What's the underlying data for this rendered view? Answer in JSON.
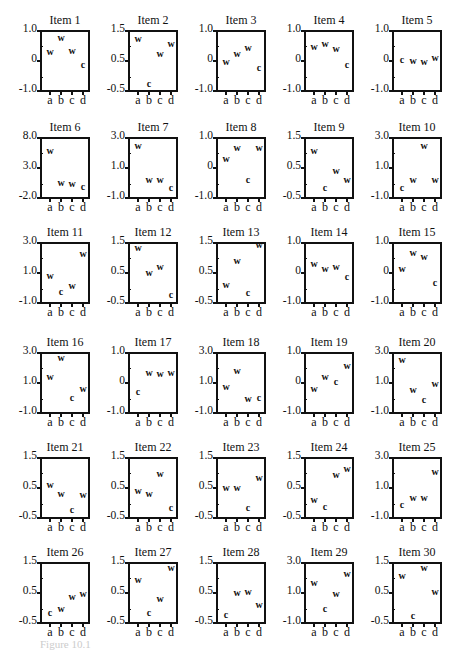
{
  "chart_data": {
    "type": "scatter",
    "layout": "small multiples, 6 rows x 5 columns",
    "categories": [
      "a",
      "b",
      "c",
      "d"
    ],
    "marker_legend": {
      "w": "w marker",
      "c": "c marker"
    },
    "panels": [
      {
        "title": "Item 1",
        "ylim": [
          -1.0,
          1.0
        ],
        "yticks": [
          "1.0",
          "0",
          "-1.0"
        ],
        "points": [
          {
            "x": "a",
            "y": 0.3,
            "m": "w"
          },
          {
            "x": "b",
            "y": 0.8,
            "m": "w"
          },
          {
            "x": "c",
            "y": 0.35,
            "m": "w"
          },
          {
            "x": "d",
            "y": -0.15,
            "m": "c"
          }
        ]
      },
      {
        "title": "Item 2",
        "ylim": [
          -0.5,
          1.5
        ],
        "yticks": [
          "1.5",
          "0.5",
          "-0.5"
        ],
        "points": [
          {
            "x": "a",
            "y": 1.25,
            "m": "w"
          },
          {
            "x": "b",
            "y": -0.3,
            "m": "c"
          },
          {
            "x": "c",
            "y": 0.75,
            "m": "w"
          },
          {
            "x": "d",
            "y": 1.1,
            "m": "w"
          }
        ]
      },
      {
        "title": "Item 3",
        "ylim": [
          -1.0,
          1.0
        ],
        "yticks": [
          "1.0",
          "0",
          "-1.0"
        ],
        "points": [
          {
            "x": "a",
            "y": -0.05,
            "m": "w"
          },
          {
            "x": "b",
            "y": 0.25,
            "m": "w"
          },
          {
            "x": "c",
            "y": 0.45,
            "m": "w"
          },
          {
            "x": "d",
            "y": -0.25,
            "m": "c"
          }
        ]
      },
      {
        "title": "Item 4",
        "ylim": [
          -1.0,
          1.0
        ],
        "yticks": [
          "1.0",
          "0",
          "-1.0"
        ],
        "points": [
          {
            "x": "a",
            "y": 0.5,
            "m": "w"
          },
          {
            "x": "b",
            "y": 0.6,
            "m": "w"
          },
          {
            "x": "c",
            "y": 0.4,
            "m": "w"
          },
          {
            "x": "d",
            "y": -0.15,
            "m": "c"
          }
        ]
      },
      {
        "title": "Item 5",
        "ylim": [
          -1.0,
          1.0
        ],
        "yticks": [
          "1.0",
          "0",
          "-1.0"
        ],
        "points": [
          {
            "x": "a",
            "y": 0.05,
            "m": "c"
          },
          {
            "x": "b",
            "y": 0.0,
            "m": "w"
          },
          {
            "x": "c",
            "y": -0.05,
            "m": "w"
          },
          {
            "x": "d",
            "y": 0.1,
            "m": "w"
          }
        ]
      },
      {
        "title": "Item 6",
        "ylim": [
          -2.0,
          8.0
        ],
        "yticks": [
          "8.0",
          "3.0",
          "-2.0"
        ],
        "points": [
          {
            "x": "a",
            "y": 6.0,
            "m": "w"
          },
          {
            "x": "b",
            "y": 0.5,
            "m": "w"
          },
          {
            "x": "c",
            "y": 0.3,
            "m": "w"
          },
          {
            "x": "d",
            "y": -0.2,
            "m": "c"
          }
        ]
      },
      {
        "title": "Item 7",
        "ylim": [
          -1.0,
          3.0
        ],
        "yticks": [
          "3.0",
          "1.0",
          "-1.0"
        ],
        "points": [
          {
            "x": "a",
            "y": 2.5,
            "m": "w"
          },
          {
            "x": "b",
            "y": 0.2,
            "m": "w"
          },
          {
            "x": "c",
            "y": 0.2,
            "m": "w"
          },
          {
            "x": "d",
            "y": -0.4,
            "m": "c"
          }
        ]
      },
      {
        "title": "Item 8",
        "ylim": [
          -1.0,
          1.0
        ],
        "yticks": [
          "1.0",
          "0",
          "-1.0"
        ],
        "points": [
          {
            "x": "a",
            "y": 0.3,
            "m": "w"
          },
          {
            "x": "b",
            "y": 0.7,
            "m": "w"
          },
          {
            "x": "c",
            "y": -0.4,
            "m": "c"
          },
          {
            "x": "d",
            "y": 0.7,
            "m": "w"
          }
        ]
      },
      {
        "title": "Item 9",
        "ylim": [
          -0.5,
          1.5
        ],
        "yticks": [
          "1.5",
          "0.5",
          "-0.5"
        ],
        "points": [
          {
            "x": "a",
            "y": 1.1,
            "m": "w"
          },
          {
            "x": "b",
            "y": -0.2,
            "m": "c"
          },
          {
            "x": "c",
            "y": 0.4,
            "m": "w"
          },
          {
            "x": "d",
            "y": 0.1,
            "m": "w"
          }
        ]
      },
      {
        "title": "Item 10",
        "ylim": [
          -1.0,
          3.0
        ],
        "yticks": [
          "3.0",
          "1.0",
          "-1.0"
        ],
        "points": [
          {
            "x": "a",
            "y": -0.4,
            "m": "c"
          },
          {
            "x": "b",
            "y": 0.2,
            "m": "w"
          },
          {
            "x": "c",
            "y": 2.5,
            "m": "w"
          },
          {
            "x": "d",
            "y": 0.2,
            "m": "w"
          }
        ]
      },
      {
        "title": "Item 11",
        "ylim": [
          -1.0,
          3.0
        ],
        "yticks": [
          "3.0",
          "1.0",
          "-1.0"
        ],
        "points": [
          {
            "x": "a",
            "y": 0.8,
            "m": "w"
          },
          {
            "x": "b",
            "y": -0.3,
            "m": "c"
          },
          {
            "x": "c",
            "y": 0.1,
            "m": "w"
          },
          {
            "x": "d",
            "y": 2.3,
            "m": "w"
          }
        ]
      },
      {
        "title": "Item 12",
        "ylim": [
          -0.5,
          1.5
        ],
        "yticks": [
          "1.5",
          "0.5",
          "-0.5"
        ],
        "points": [
          {
            "x": "a",
            "y": 1.35,
            "m": "w"
          },
          {
            "x": "b",
            "y": 0.5,
            "m": "w"
          },
          {
            "x": "c",
            "y": 0.7,
            "m": "w"
          },
          {
            "x": "d",
            "y": -0.25,
            "m": "c"
          }
        ]
      },
      {
        "title": "Item 13",
        "ylim": [
          -0.5,
          1.5
        ],
        "yticks": [
          "1.5",
          "0.5",
          "-0.5"
        ],
        "points": [
          {
            "x": "a",
            "y": 0.1,
            "m": "w"
          },
          {
            "x": "b",
            "y": 0.9,
            "m": "w"
          },
          {
            "x": "c",
            "y": -0.2,
            "m": "c"
          },
          {
            "x": "d",
            "y": 1.45,
            "m": "w"
          }
        ]
      },
      {
        "title": "Item 14",
        "ylim": [
          -1.0,
          1.0
        ],
        "yticks": [
          "1.0",
          "0",
          "-1.0"
        ],
        "points": [
          {
            "x": "a",
            "y": 0.3,
            "m": "w"
          },
          {
            "x": "b",
            "y": 0.15,
            "m": "w"
          },
          {
            "x": "c",
            "y": 0.2,
            "m": "w"
          },
          {
            "x": "d",
            "y": -0.15,
            "m": "c"
          }
        ]
      },
      {
        "title": "Item 15",
        "ylim": [
          -1.0,
          1.0
        ],
        "yticks": [
          "1.0",
          "0",
          "-1.0"
        ],
        "points": [
          {
            "x": "a",
            "y": 0.15,
            "m": "w"
          },
          {
            "x": "b",
            "y": 0.7,
            "m": "w"
          },
          {
            "x": "c",
            "y": 0.55,
            "m": "w"
          },
          {
            "x": "d",
            "y": -0.35,
            "m": "c"
          }
        ]
      },
      {
        "title": "Item 16",
        "ylim": [
          -1.0,
          3.0
        ],
        "yticks": [
          "3.0",
          "1.0",
          "-1.0"
        ],
        "points": [
          {
            "x": "a",
            "y": 1.4,
            "m": "w"
          },
          {
            "x": "b",
            "y": 2.7,
            "m": "w"
          },
          {
            "x": "c",
            "y": 0.0,
            "m": "c"
          },
          {
            "x": "d",
            "y": 0.6,
            "m": "w"
          }
        ]
      },
      {
        "title": "Item 17",
        "ylim": [
          -1.0,
          1.0
        ],
        "yticks": [
          "1.0",
          "0",
          "-1.0"
        ],
        "points": [
          {
            "x": "a",
            "y": -0.3,
            "m": "c"
          },
          {
            "x": "b",
            "y": 0.35,
            "m": "w"
          },
          {
            "x": "c",
            "y": 0.3,
            "m": "w"
          },
          {
            "x": "d",
            "y": 0.35,
            "m": "w"
          }
        ]
      },
      {
        "title": "Item 18",
        "ylim": [
          -1.0,
          3.0
        ],
        "yticks": [
          "3.0",
          "1.0",
          "-1.0"
        ],
        "points": [
          {
            "x": "a",
            "y": 0.7,
            "m": "w"
          },
          {
            "x": "b",
            "y": 1.8,
            "m": "w"
          },
          {
            "x": "c",
            "y": -0.1,
            "m": "w"
          },
          {
            "x": "d",
            "y": 0.0,
            "m": "c"
          }
        ]
      },
      {
        "title": "Item 19",
        "ylim": [
          -1.0,
          1.0
        ],
        "yticks": [
          "1.0",
          "0",
          "-1.0"
        ],
        "points": [
          {
            "x": "a",
            "y": -0.2,
            "m": "w"
          },
          {
            "x": "b",
            "y": 0.2,
            "m": "w"
          },
          {
            "x": "c",
            "y": 0.05,
            "m": "c"
          },
          {
            "x": "d",
            "y": 0.6,
            "m": "w"
          }
        ]
      },
      {
        "title": "Item 20",
        "ylim": [
          -1.0,
          3.0
        ],
        "yticks": [
          "3.0",
          "1.0",
          "-1.0"
        ],
        "points": [
          {
            "x": "a",
            "y": 2.6,
            "m": "w"
          },
          {
            "x": "b",
            "y": 0.5,
            "m": "w"
          },
          {
            "x": "c",
            "y": -0.2,
            "m": "c"
          },
          {
            "x": "d",
            "y": 0.9,
            "m": "w"
          }
        ]
      },
      {
        "title": "Item 21",
        "ylim": [
          -0.5,
          1.5
        ],
        "yticks": [
          "1.5",
          "0.5",
          "-0.5"
        ],
        "points": [
          {
            "x": "a",
            "y": 0.6,
            "m": "w"
          },
          {
            "x": "b",
            "y": 0.3,
            "m": "w"
          },
          {
            "x": "c",
            "y": -0.25,
            "m": "c"
          },
          {
            "x": "d",
            "y": 0.25,
            "m": "w"
          }
        ]
      },
      {
        "title": "Item 22",
        "ylim": [
          -0.5,
          1.5
        ],
        "yticks": [
          "1.5",
          "0.5",
          "-0.5"
        ],
        "points": [
          {
            "x": "a",
            "y": 0.4,
            "m": "w"
          },
          {
            "x": "b",
            "y": 0.3,
            "m": "w"
          },
          {
            "x": "c",
            "y": 1.0,
            "m": "w"
          },
          {
            "x": "d",
            "y": -0.2,
            "m": "c"
          }
        ]
      },
      {
        "title": "Item 23",
        "ylim": [
          -0.5,
          1.5
        ],
        "yticks": [
          "1.5",
          "0.5",
          "-0.5"
        ],
        "points": [
          {
            "x": "a",
            "y": 0.5,
            "m": "w"
          },
          {
            "x": "b",
            "y": 0.5,
            "m": "w"
          },
          {
            "x": "c",
            "y": -0.2,
            "m": "c"
          },
          {
            "x": "d",
            "y": 0.85,
            "m": "w"
          }
        ]
      },
      {
        "title": "Item 24",
        "ylim": [
          -0.5,
          1.5
        ],
        "yticks": [
          "1.5",
          "0.5",
          "-0.5"
        ],
        "points": [
          {
            "x": "a",
            "y": 0.1,
            "m": "w"
          },
          {
            "x": "b",
            "y": -0.15,
            "m": "c"
          },
          {
            "x": "c",
            "y": 0.95,
            "m": "w"
          },
          {
            "x": "d",
            "y": 1.15,
            "m": "w"
          }
        ]
      },
      {
        "title": "Item 25",
        "ylim": [
          -1.0,
          3.0
        ],
        "yticks": [
          "3.0",
          "1.0",
          "-1.0"
        ],
        "points": [
          {
            "x": "a",
            "y": -0.2,
            "m": "c"
          },
          {
            "x": "b",
            "y": 0.3,
            "m": "w"
          },
          {
            "x": "c",
            "y": 0.3,
            "m": "w"
          },
          {
            "x": "d",
            "y": 2.1,
            "m": "w"
          }
        ]
      },
      {
        "title": "Item 26",
        "ylim": [
          -0.5,
          1.5
        ],
        "yticks": [
          "1.5",
          "0.5",
          "-0.5"
        ],
        "points": [
          {
            "x": "a",
            "y": -0.2,
            "m": "c"
          },
          {
            "x": "b",
            "y": -0.05,
            "m": "w"
          },
          {
            "x": "c",
            "y": 0.35,
            "m": "w"
          },
          {
            "x": "d",
            "y": 0.45,
            "m": "w"
          }
        ]
      },
      {
        "title": "Item 27",
        "ylim": [
          -0.5,
          1.5
        ],
        "yticks": [
          "1.5",
          "0.5",
          "-0.5"
        ],
        "points": [
          {
            "x": "a",
            "y": 0.95,
            "m": "w"
          },
          {
            "x": "b",
            "y": -0.2,
            "m": "c"
          },
          {
            "x": "c",
            "y": 0.3,
            "m": "w"
          },
          {
            "x": "d",
            "y": 1.35,
            "m": "w"
          }
        ]
      },
      {
        "title": "Item 28",
        "ylim": [
          -0.5,
          1.5
        ],
        "yticks": [
          "1.5",
          "0.5",
          "-0.5"
        ],
        "points": [
          {
            "x": "a",
            "y": -0.25,
            "m": "c"
          },
          {
            "x": "b",
            "y": 0.5,
            "m": "w"
          },
          {
            "x": "c",
            "y": 0.55,
            "m": "w"
          },
          {
            "x": "d",
            "y": 0.1,
            "m": "w"
          }
        ]
      },
      {
        "title": "Item 29",
        "ylim": [
          -1.0,
          3.0
        ],
        "yticks": [
          "3.0",
          "1.0",
          "-1.0"
        ],
        "points": [
          {
            "x": "a",
            "y": 1.7,
            "m": "w"
          },
          {
            "x": "b",
            "y": -0.1,
            "m": "c"
          },
          {
            "x": "c",
            "y": 0.9,
            "m": "w"
          },
          {
            "x": "d",
            "y": 2.3,
            "m": "w"
          }
        ]
      },
      {
        "title": "Item 30",
        "ylim": [
          -0.5,
          1.5
        ],
        "yticks": [
          "1.5",
          "0.5",
          "-0.5"
        ],
        "points": [
          {
            "x": "a",
            "y": 1.1,
            "m": "w"
          },
          {
            "x": "b",
            "y": -0.3,
            "m": "c"
          },
          {
            "x": "c",
            "y": 1.35,
            "m": "w"
          },
          {
            "x": "d",
            "y": 0.55,
            "m": "w"
          }
        ]
      }
    ]
  },
  "caption": "Figure 10.1"
}
